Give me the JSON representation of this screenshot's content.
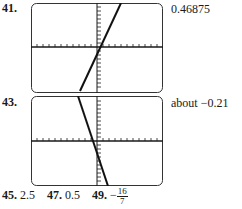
{
  "problems": [
    {
      "number": "41.",
      "answer": "0.46875",
      "graph": {
        "line": {
          "x1": 49,
          "y1": 88,
          "x2": 90,
          "y2": 0
        }
      }
    },
    {
      "number": "43.",
      "answer": "about −0.21",
      "graph": {
        "line": {
          "x1": 47,
          "y1": 0,
          "x2": 77,
          "y2": 90
        }
      }
    }
  ],
  "bottom_row": [
    {
      "number": "45.",
      "answer": "2.5"
    },
    {
      "number": "47.",
      "answer": "0.5"
    },
    {
      "number": "49.",
      "answer_sign": "−",
      "answer_numerator": "16",
      "answer_denominator": "7"
    }
  ],
  "colors": {
    "ink": "#1a1a1a",
    "frame": "#333333"
  }
}
